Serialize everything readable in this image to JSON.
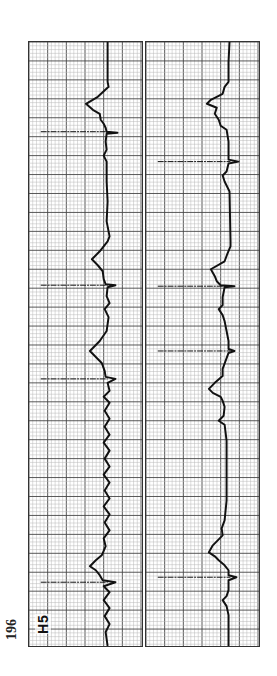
{
  "page": {
    "number": "196"
  },
  "figure": {
    "lead_label": "H5",
    "orientation": "rotated 90° counter-clockwise",
    "colors": {
      "paper": "#ffffff",
      "grid_minor": "#b8b8b8",
      "grid_major": "#444444",
      "trace": "#111111"
    },
    "grid": {
      "minor_px": 3.8,
      "major_every": 5
    },
    "strips": [
      {
        "id": "left",
        "baseline_x": 80,
        "pacer_spikes_y": [
          90,
          244,
          338,
          542
        ],
        "trace": [
          [
            80,
            0
          ],
          [
            80,
            40
          ],
          [
            81,
            45
          ],
          [
            70,
            55
          ],
          [
            58,
            62
          ],
          [
            65,
            68
          ],
          [
            72,
            72
          ],
          [
            73,
            78
          ],
          [
            76,
            82
          ],
          [
            78,
            86
          ],
          [
            79,
            90
          ],
          [
            90,
            91
          ],
          [
            79,
            92
          ],
          [
            78,
            100
          ],
          [
            79,
            108
          ],
          [
            76,
            114
          ],
          [
            79,
            120
          ],
          [
            79,
            140
          ],
          [
            80,
            160
          ],
          [
            79,
            180
          ],
          [
            82,
            195
          ],
          [
            80,
            200
          ],
          [
            72,
            210
          ],
          [
            64,
            218
          ],
          [
            70,
            224
          ],
          [
            75,
            230
          ],
          [
            76,
            238
          ],
          [
            78,
            243
          ],
          [
            88,
            244
          ],
          [
            80,
            246
          ],
          [
            79,
            255
          ],
          [
            82,
            262
          ],
          [
            77,
            268
          ],
          [
            81,
            276
          ],
          [
            79,
            290
          ],
          [
            72,
            300
          ],
          [
            62,
            310
          ],
          [
            68,
            316
          ],
          [
            74,
            322
          ],
          [
            77,
            330
          ],
          [
            78,
            336
          ],
          [
            88,
            338
          ],
          [
            80,
            342
          ],
          [
            82,
            350
          ],
          [
            76,
            356
          ],
          [
            82,
            362
          ],
          [
            77,
            370
          ],
          [
            82,
            378
          ],
          [
            77,
            386
          ],
          [
            82,
            394
          ],
          [
            76,
            402
          ],
          [
            82,
            410
          ],
          [
            77,
            418
          ],
          [
            82,
            426
          ],
          [
            76,
            434
          ],
          [
            82,
            442
          ],
          [
            77,
            450
          ],
          [
            82,
            458
          ],
          [
            76,
            466
          ],
          [
            82,
            474
          ],
          [
            77,
            482
          ],
          [
            82,
            490
          ],
          [
            76,
            498
          ],
          [
            78,
            506
          ],
          [
            74,
            515
          ],
          [
            68,
            520
          ],
          [
            62,
            526
          ],
          [
            68,
            530
          ],
          [
            72,
            535
          ],
          [
            75,
            540
          ],
          [
            88,
            542
          ],
          [
            76,
            546
          ],
          [
            82,
            552
          ],
          [
            76,
            560
          ],
          [
            82,
            568
          ],
          [
            77,
            576
          ],
          [
            82,
            584
          ],
          [
            78,
            592
          ],
          [
            80,
            606
          ]
        ]
      },
      {
        "id": "right",
        "baseline_x": 86,
        "pacer_spikes_y": [
          120,
          245,
          310,
          537
        ],
        "trace": [
          [
            85,
            0
          ],
          [
            84,
            20
          ],
          [
            84,
            40
          ],
          [
            80,
            45
          ],
          [
            78,
            52
          ],
          [
            66,
            58
          ],
          [
            62,
            62
          ],
          [
            72,
            66
          ],
          [
            70,
            72
          ],
          [
            74,
            78
          ],
          [
            76,
            84
          ],
          [
            82,
            88
          ],
          [
            84,
            100
          ],
          [
            84,
            118
          ],
          [
            94,
            120
          ],
          [
            84,
            122
          ],
          [
            82,
            130
          ],
          [
            78,
            134
          ],
          [
            80,
            140
          ],
          [
            85,
            150
          ],
          [
            86,
            200
          ],
          [
            86,
            205
          ],
          [
            83,
            212
          ],
          [
            80,
            220
          ],
          [
            66,
            228
          ],
          [
            70,
            235
          ],
          [
            72,
            240
          ],
          [
            76,
            244
          ],
          [
            90,
            245
          ],
          [
            80,
            246
          ],
          [
            78,
            256
          ],
          [
            78,
            264
          ],
          [
            74,
            268
          ],
          [
            78,
            274
          ],
          [
            80,
            280
          ],
          [
            82,
            290
          ],
          [
            84,
            300
          ],
          [
            84,
            308
          ],
          [
            90,
            310
          ],
          [
            84,
            312
          ],
          [
            81,
            320
          ],
          [
            78,
            328
          ],
          [
            78,
            335
          ],
          [
            70,
            342
          ],
          [
            64,
            348
          ],
          [
            68,
            352
          ],
          [
            76,
            356
          ],
          [
            78,
            360
          ],
          [
            80,
            366
          ],
          [
            79,
            375
          ],
          [
            74,
            380
          ],
          [
            80,
            384
          ],
          [
            82,
            400
          ],
          [
            82,
            430
          ],
          [
            82,
            460
          ],
          [
            80,
            480
          ],
          [
            77,
            488
          ],
          [
            78,
            495
          ],
          [
            68,
            505
          ],
          [
            64,
            512
          ],
          [
            70,
            516
          ],
          [
            74,
            520
          ],
          [
            80,
            525
          ],
          [
            84,
            530
          ],
          [
            84,
            535
          ],
          [
            92,
            537
          ],
          [
            84,
            540
          ],
          [
            84,
            550
          ],
          [
            82,
            556
          ],
          [
            78,
            560
          ],
          [
            82,
            566
          ],
          [
            84,
            575
          ],
          [
            84,
            606
          ]
        ]
      }
    ]
  }
}
